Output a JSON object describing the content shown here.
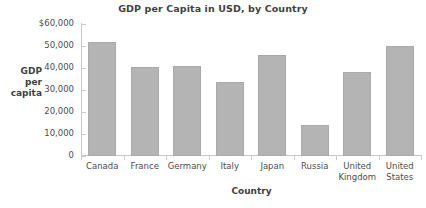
{
  "chart_data": {
    "type": "bar",
    "title": "GDP per Capita in USD, by Country",
    "xlabel": "Country",
    "ylabel": "GDP per capita",
    "ylabel_lines": [
      "GDP",
      "per",
      "capita"
    ],
    "categories": [
      "Canada",
      "France",
      "Germany",
      "Italy",
      "Japan",
      "Russia",
      "United Kingdom",
      "United States"
    ],
    "category_lines": [
      [
        "Canada"
      ],
      [
        "France"
      ],
      [
        "Germany"
      ],
      [
        "Italy"
      ],
      [
        "Japan"
      ],
      [
        "Russia"
      ],
      [
        "United",
        "Kingdom"
      ],
      [
        "United",
        "States"
      ]
    ],
    "values": [
      51700,
      40500,
      41000,
      33500,
      45800,
      14000,
      38000,
      50000
    ],
    "ylim": [
      0,
      60000
    ],
    "yticks": [
      0,
      10000,
      20000,
      30000,
      40000,
      50000,
      60000
    ],
    "ytick_labels": [
      "0",
      "10,000",
      "20,000",
      "30,000",
      "40,000",
      "50,000",
      "$60,000"
    ],
    "grid": false,
    "legend": null,
    "bar_color": "#b4b4b4",
    "axis_color": "#c9c9c9",
    "text_color": "#4d4d4d"
  }
}
